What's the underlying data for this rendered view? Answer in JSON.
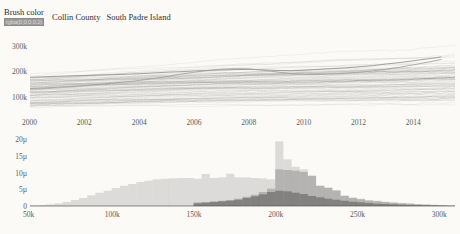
{
  "controls": {
    "brush_color_label": "Brush color",
    "brush_color_value": "rgba(0,0,0,0.2)"
  },
  "legend": {
    "items": [
      {
        "label": "Collin County"
      },
      {
        "label": "South Padre Island"
      }
    ]
  },
  "chart_data": [
    {
      "id": "timeseries",
      "type": "line",
      "title": "",
      "xlabel": "",
      "ylabel": "",
      "xlim": [
        2000,
        2015.5
      ],
      "ylim": [
        40000,
        330000
      ],
      "grid": false,
      "legend_position": "top",
      "xticks": [
        "2000",
        "2002",
        "2004",
        "2006",
        "2008",
        "2010",
        "2012",
        "2014"
      ],
      "xtick_values": [
        2000,
        2002,
        2004,
        2006,
        2008,
        2010,
        2012,
        2014
      ],
      "yticks": [
        "100k",
        "200k",
        "300k"
      ],
      "ytick_values": [
        100000,
        200000,
        300000
      ],
      "series": [
        {
          "name": "Collin County",
          "color": "#8a8a8a",
          "x": [
            2000.0,
            2000.5,
            2001.0,
            2001.5,
            2002.0,
            2002.5,
            2003.0,
            2003.5,
            2004.0,
            2004.5,
            2005.0,
            2005.5,
            2006.0,
            2006.5,
            2007.0,
            2007.5,
            2008.0,
            2008.5,
            2009.0,
            2009.5,
            2010.0,
            2010.5,
            2011.0,
            2011.5,
            2012.0,
            2012.5,
            2013.0,
            2013.5,
            2014.0,
            2014.5,
            2015.0
          ],
          "values": [
            176000,
            178000,
            180000,
            182000,
            183000,
            185000,
            186000,
            188000,
            190000,
            193000,
            196000,
            198000,
            201000,
            203000,
            205000,
            206000,
            207000,
            205000,
            203000,
            202000,
            204000,
            207000,
            210000,
            213000,
            217000,
            222000,
            228000,
            234000,
            241000,
            248000,
            256000
          ]
        },
        {
          "name": "South Padre Island",
          "color": "#9a9a9a",
          "x": [
            2000.0,
            2000.5,
            2001.0,
            2001.5,
            2002.0,
            2002.5,
            2003.0,
            2003.5,
            2004.0,
            2004.5,
            2005.0,
            2005.5,
            2006.0,
            2006.5,
            2007.0,
            2007.5,
            2008.0,
            2008.5,
            2009.0,
            2009.5,
            2010.0,
            2010.5,
            2011.0,
            2011.5,
            2012.0,
            2012.5,
            2013.0,
            2013.5,
            2014.0,
            2014.5,
            2015.0
          ],
          "values": [
            132000,
            134000,
            137000,
            140000,
            144000,
            148000,
            153000,
            158000,
            164000,
            171000,
            179000,
            188000,
            196000,
            203000,
            208000,
            210000,
            209000,
            204000,
            197000,
            191000,
            188000,
            187000,
            189000,
            192000,
            196000,
            201000,
            208000,
            216000,
            225000,
            235000,
            246000
          ]
        }
      ],
      "background_series_count": 90,
      "background_color": "rgba(0,0,0,0.10)",
      "note": "dense bundle of ~90 faint home-price time series, two highlighted"
    },
    {
      "id": "price-histogram",
      "type": "bar",
      "title": "",
      "xlabel": "",
      "ylabel": "",
      "xlim": [
        50000,
        310000
      ],
      "ylim": [
        0,
        21
      ],
      "grid": false,
      "xticks": [
        "50k",
        "100k",
        "150k",
        "200k",
        "250k",
        "300k"
      ],
      "xtick_values": [
        50000,
        100000,
        150000,
        200000,
        250000,
        300000
      ],
      "yticks": [
        "0",
        "5µ",
        "10µ",
        "15µ",
        "20µ"
      ],
      "ytick_values": [
        0,
        5,
        10,
        15,
        20
      ],
      "bin_width": 5000,
      "bin_starts": [
        50000,
        55000,
        60000,
        65000,
        70000,
        75000,
        80000,
        85000,
        90000,
        95000,
        100000,
        105000,
        110000,
        115000,
        120000,
        125000,
        130000,
        135000,
        140000,
        145000,
        150000,
        155000,
        160000,
        165000,
        170000,
        175000,
        180000,
        185000,
        190000,
        195000,
        200000,
        205000,
        210000,
        215000,
        220000,
        225000,
        230000,
        235000,
        240000,
        245000,
        250000,
        255000,
        260000,
        265000,
        270000,
        275000,
        280000,
        285000,
        290000,
        295000,
        300000,
        305000
      ],
      "series": [
        {
          "name": "all (background)",
          "color": "rgba(0,0,0,0.12)",
          "values": [
            0.2,
            0.3,
            0.5,
            0.8,
            1.2,
            1.8,
            2.4,
            3.2,
            4.0,
            4.6,
            5.4,
            6.1,
            6.6,
            7.2,
            7.6,
            8.0,
            8.2,
            8.3,
            8.4,
            8.4,
            8.2,
            9.6,
            8.4,
            8.6,
            9.7,
            8.6,
            8.6,
            8.4,
            8.3,
            8.0,
            19.4,
            14.0,
            11.8,
            11.0,
            9.2,
            6.2,
            5.6,
            4.8,
            3.2,
            2.6,
            2.2,
            1.8,
            1.6,
            1.3,
            1.1,
            0.9,
            0.8,
            0.6,
            0.5,
            0.4,
            0.3,
            0.2
          ]
        },
        {
          "name": "Collin County",
          "color": "rgba(0,0,0,0.18)",
          "values": [
            0,
            0,
            0,
            0,
            0,
            0,
            0,
            0,
            0,
            0,
            0,
            0,
            0,
            0,
            0,
            0,
            0,
            0,
            0,
            0,
            1.1,
            1.2,
            1.4,
            1.6,
            1.8,
            2.2,
            2.8,
            3.4,
            4.2,
            5.2,
            11.0,
            10.8,
            10.6,
            10.2,
            9.0,
            6.0,
            5.4,
            4.6,
            3.0,
            2.4,
            2.0,
            1.6,
            1.4,
            1.2,
            1.0,
            0.8,
            0.7,
            0.5,
            0.4,
            0.3,
            0.2,
            0.1
          ]
        },
        {
          "name": "South Padre Island",
          "color": "rgba(0,0,0,0.28)",
          "values": [
            0,
            0,
            0,
            0,
            0,
            0,
            0,
            0,
            0,
            0,
            0,
            0,
            0,
            0,
            0,
            0,
            0,
            0,
            0,
            0,
            0.8,
            1.0,
            1.2,
            1.4,
            1.6,
            1.9,
            2.4,
            2.9,
            3.5,
            4.2,
            4.6,
            4.4,
            4.0,
            3.6,
            3.0,
            2.6,
            2.2,
            1.9,
            1.6,
            1.3,
            1.1,
            0.9,
            0.7,
            0.6,
            0.5,
            0.4,
            0.3,
            0.25,
            0.2,
            0.15,
            0.1,
            0.05
          ]
        }
      ]
    }
  ]
}
